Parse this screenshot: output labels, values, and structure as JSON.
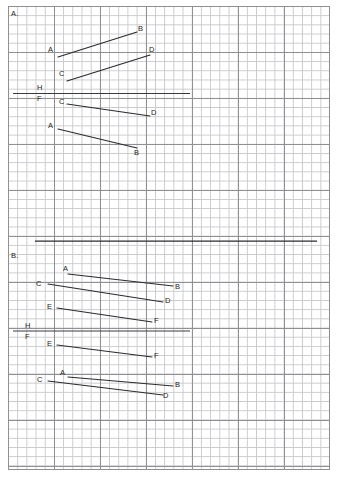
{
  "page": {
    "background_color": "#ffffff",
    "grid": {
      "minor_color": "#c9cace",
      "major_color": "#8f9094",
      "minor_cell_px": 9.2,
      "major_every": 5
    },
    "ink_color": "#2b2b2f"
  },
  "sections": [
    {
      "id": "section-a",
      "label": "A.",
      "label_pos": {
        "x": 11,
        "y": 10
      },
      "reference_line": {
        "name": "ground-line-hf",
        "upper_label": "H",
        "lower_label": "F",
        "upper_label_pos": {
          "x": 37,
          "y": 84
        },
        "lower_label_pos": {
          "x": 37,
          "y": 95
        },
        "x1": 13,
        "y1": 93.5,
        "x2": 190,
        "y2": 93.5
      },
      "segments": [
        {
          "name": "segment-ab-top",
          "from": {
            "label": "A",
            "x": 58,
            "y": 57
          },
          "to": {
            "label": "B",
            "x": 137,
            "y": 32
          },
          "from_label_pos": {
            "x": 48,
            "y": 46
          },
          "to_label_pos": {
            "x": 138,
            "y": 25
          }
        },
        {
          "name": "segment-cd-top",
          "from": {
            "label": "C",
            "x": 67,
            "y": 81
          },
          "to": {
            "label": "D",
            "x": 150,
            "y": 55
          },
          "from_label_pos": {
            "x": 59,
            "y": 70
          },
          "to_label_pos": {
            "x": 149,
            "y": 46
          }
        },
        {
          "name": "segment-cd-bottom",
          "from": {
            "label": "C",
            "x": 67,
            "y": 104
          },
          "to": {
            "label": "D",
            "x": 150,
            "y": 116
          },
          "from_label_pos": {
            "x": 59,
            "y": 98
          },
          "to_label_pos": {
            "x": 151,
            "y": 109
          }
        },
        {
          "name": "segment-ab-bottom",
          "from": {
            "label": "A",
            "x": 58,
            "y": 129
          },
          "to": {
            "label": "B",
            "x": 137,
            "y": 148
          },
          "from_label_pos": {
            "x": 48,
            "y": 122
          },
          "to_label_pos": {
            "x": 134,
            "y": 149
          }
        }
      ]
    },
    {
      "id": "section-b",
      "label": "B.",
      "label_pos": {
        "x": 11,
        "y": 252
      },
      "divider_line": {
        "name": "section-divider",
        "x1": 35,
        "y1": 241,
        "x2": 317,
        "y2": 241
      },
      "reference_line": {
        "name": "ground-line-hf",
        "upper_label": "H",
        "lower_label": "F",
        "upper_label_pos": {
          "x": 25,
          "y": 322
        },
        "lower_label_pos": {
          "x": 25,
          "y": 333
        },
        "x1": 13,
        "y1": 331,
        "x2": 190,
        "y2": 331
      },
      "segments": [
        {
          "name": "segment-ab-top",
          "from": {
            "label": "A",
            "x": 68,
            "y": 274
          },
          "to": {
            "label": "B",
            "x": 173,
            "y": 286
          },
          "from_label_pos": {
            "x": 63,
            "y": 265
          },
          "to_label_pos": {
            "x": 175,
            "y": 283
          }
        },
        {
          "name": "segment-cd-top",
          "from": {
            "label": "C",
            "x": 48,
            "y": 284
          },
          "to": {
            "label": "D",
            "x": 163,
            "y": 302
          },
          "from_label_pos": {
            "x": 36,
            "y": 280
          },
          "to_label_pos": {
            "x": 165,
            "y": 297
          }
        },
        {
          "name": "segment-ef-top",
          "from": {
            "label": "E",
            "x": 57,
            "y": 308
          },
          "to": {
            "label": "F",
            "x": 152,
            "y": 322
          },
          "from_label_pos": {
            "x": 47,
            "y": 303
          },
          "to_label_pos": {
            "x": 154,
            "y": 317
          }
        },
        {
          "name": "segment-ef-bottom",
          "from": {
            "label": "E",
            "x": 57,
            "y": 345
          },
          "to": {
            "label": "F",
            "x": 152,
            "y": 357
          },
          "from_label_pos": {
            "x": 47,
            "y": 340
          },
          "to_label_pos": {
            "x": 154,
            "y": 352
          }
        },
        {
          "name": "segment-ab-bottom",
          "from": {
            "label": "A",
            "x": 68,
            "y": 377
          },
          "to": {
            "label": "B",
            "x": 173,
            "y": 386
          },
          "from_label_pos": {
            "x": 60,
            "y": 369
          },
          "to_label_pos": {
            "x": 175,
            "y": 381
          }
        },
        {
          "name": "segment-cd-bottom",
          "from": {
            "label": "C",
            "x": 48,
            "y": 381
          },
          "to": {
            "label": "D",
            "x": 163,
            "y": 395
          },
          "from_label_pos": {
            "x": 37,
            "y": 376
          },
          "to_label_pos": {
            "x": 163,
            "y": 392
          }
        }
      ]
    }
  ]
}
